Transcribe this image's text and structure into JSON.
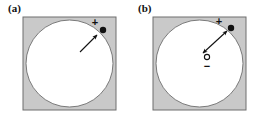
{
  "figure": {
    "type": "scientific-diagram",
    "width": 261,
    "height": 125,
    "background_color": "#ffffff",
    "panel_count": 2
  },
  "colors": {
    "matrix_gray": "#c9c9c9",
    "matrix_border": "#6e6e6e",
    "cavity_white": "#ffffff",
    "cavity_outline": "#7a7a7a",
    "marker_black": "#111111",
    "arrow_black": "#111111",
    "label_text": "#111111"
  },
  "panels": [
    {
      "id": "a",
      "label": "(a)",
      "square": {
        "name": "gray-matrix-square",
        "x": 23,
        "y": 17,
        "width": 93,
        "height": 93,
        "fill": "#c9c9c9"
      },
      "circle": {
        "name": "white-cavity-circle",
        "cx": 69.5,
        "cy": 63.5,
        "r": 43.5,
        "fill": "#ffffff"
      },
      "markers": [
        {
          "name": "positive-charge-dot",
          "kind": "filled-dot",
          "label": "+",
          "cx": 103,
          "cy": 30,
          "r": 3.2,
          "label_x": 95,
          "label_y": 26
        }
      ],
      "arrows": [
        {
          "name": "single-headed-arrow",
          "heads": 1,
          "x1": 80,
          "y1": 52,
          "x2": 97,
          "y2": 35
        }
      ]
    },
    {
      "id": "b",
      "label": "(b)",
      "square": {
        "name": "gray-matrix-square",
        "x": 23,
        "y": 17,
        "width": 93,
        "height": 93,
        "fill": "#c9c9c9"
      },
      "circle": {
        "name": "white-cavity-circle",
        "cx": 69.5,
        "cy": 63.5,
        "r": 43.5,
        "fill": "#ffffff"
      },
      "markers": [
        {
          "name": "positive-charge-dot",
          "kind": "filled-dot",
          "label": "+",
          "cx": 101,
          "cy": 28,
          "r": 3.2,
          "label_x": 89,
          "label_y": 25
        },
        {
          "name": "negative-charge-open-circle",
          "kind": "open-circle",
          "label": "−",
          "cx": 77,
          "cy": 57,
          "r": 2.6,
          "label_x": 77,
          "label_y": 70
        }
      ],
      "arrows": [
        {
          "name": "double-headed-arrow",
          "heads": 2,
          "x1": 73,
          "y1": 53,
          "x2": 97,
          "y2": 31
        }
      ]
    }
  ]
}
